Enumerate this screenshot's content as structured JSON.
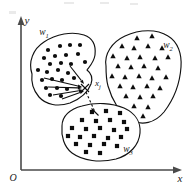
{
  "figure": {
    "title_text": "",
    "axes": {
      "x_label": "x",
      "y_label": "y",
      "origin_label": "O"
    },
    "point_of_interest": {
      "label_base": "x",
      "label_sub": "j",
      "x": 86,
      "y": 88
    },
    "clusters": [
      {
        "id": "w1",
        "label_base": "w",
        "label_sub": "1",
        "marker": "circle",
        "label_x": 44,
        "label_y": 35,
        "outline": "M 32,74 C 28,62 33,49 44,42 C 56,34 72,31 84,35 C 93,38 96,46 95,55 C 94,62 90,66 87,70 C 91,73 93,78 91,84 C 88,92 80,99 70,103 C 58,107 46,105 39,97 C 33,90 31,82 32,74 Z",
        "points": [
          [
            48,
            50
          ],
          [
            60,
            46
          ],
          [
            70,
            45
          ],
          [
            80,
            45
          ],
          [
            44,
            58
          ],
          [
            55,
            56
          ],
          [
            66,
            55
          ],
          [
            78,
            54
          ],
          [
            50,
            64
          ],
          [
            61,
            63
          ],
          [
            71,
            64
          ],
          [
            85,
            62
          ],
          [
            38,
            70
          ],
          [
            47,
            72
          ],
          [
            58,
            70
          ],
          [
            68,
            73
          ],
          [
            42,
            80
          ],
          [
            52,
            79
          ],
          [
            62,
            80
          ],
          [
            74,
            78
          ],
          [
            46,
            88
          ],
          [
            57,
            88
          ],
          [
            67,
            89
          ],
          [
            50,
            95
          ],
          [
            61,
            96
          ]
        ]
      },
      {
        "id": "w2",
        "label_base": "w",
        "label_sub": "2",
        "marker": "triangle",
        "label_x": 168,
        "label_y": 48,
        "outline": "M 106,66 C 104,54 112,42 125,36 C 140,29 157,29 168,36 C 178,42 182,54 181,67 C 180,82 174,99 164,112 C 155,123 142,126 131,120 C 120,114 112,100 108,86 C 106,79 106,72 106,66 Z",
        "points": [
          [
            137,
            38
          ],
          [
            152,
            36
          ],
          [
            122,
            46
          ],
          [
            134,
            48
          ],
          [
            148,
            46
          ],
          [
            162,
            48
          ],
          [
            113,
            56
          ],
          [
            127,
            58
          ],
          [
            140,
            57
          ],
          [
            155,
            58
          ],
          [
            168,
            57
          ],
          [
            118,
            66
          ],
          [
            131,
            67
          ],
          [
            144,
            66
          ],
          [
            158,
            68
          ],
          [
            112,
            76
          ],
          [
            125,
            77
          ],
          [
            139,
            76
          ],
          [
            152,
            78
          ],
          [
            166,
            77
          ],
          [
            120,
            86
          ],
          [
            133,
            87
          ],
          [
            147,
            86
          ],
          [
            160,
            88
          ],
          [
            126,
            96
          ],
          [
            140,
            97
          ],
          [
            153,
            96
          ],
          [
            134,
            106
          ],
          [
            148,
            107
          ],
          [
            143,
            116
          ]
        ]
      },
      {
        "id": "w3",
        "label_base": "w",
        "label_sub": "3",
        "marker": "square",
        "label_x": 128,
        "label_y": 152,
        "outline": "M 62,126 C 62,116 70,109 82,106 C 96,102 112,103 124,108 C 135,113 141,122 140,133 C 139,145 130,155 116,159 C 100,163 83,161 72,153 C 64,147 61,136 62,126 Z",
        "points": [
          [
            92,
            112
          ],
          [
            106,
            111
          ],
          [
            120,
            113
          ],
          [
            82,
            120
          ],
          [
            96,
            121
          ],
          [
            110,
            120
          ],
          [
            124,
            122
          ],
          [
            72,
            128
          ],
          [
            86,
            129
          ],
          [
            100,
            128
          ],
          [
            114,
            130
          ],
          [
            127,
            129
          ],
          [
            68,
            136
          ],
          [
            80,
            137
          ],
          [
            94,
            136
          ],
          [
            108,
            138
          ],
          [
            121,
            137
          ],
          [
            76,
            144
          ],
          [
            90,
            145
          ],
          [
            104,
            144
          ],
          [
            117,
            146
          ],
          [
            86,
            152
          ],
          [
            100,
            153
          ]
        ]
      }
    ],
    "arrows": [
      {
        "from_x": 44,
        "from_y": 78,
        "to_x": 82,
        "to_y": 87
      },
      {
        "from_x": 48,
        "from_y": 87,
        "to_x": 82,
        "to_y": 88
      },
      {
        "from_x": 53,
        "from_y": 95,
        "to_x": 83,
        "to_y": 90
      },
      {
        "from_x": 62,
        "from_y": 99,
        "to_x": 84,
        "to_y": 91
      },
      {
        "from_x": 70,
        "from_y": 66,
        "to_x": 84,
        "to_y": 84
      }
    ],
    "dashed_link": {
      "from_x": 86,
      "from_y": 92,
      "to_x": 95,
      "to_y": 112
    }
  }
}
